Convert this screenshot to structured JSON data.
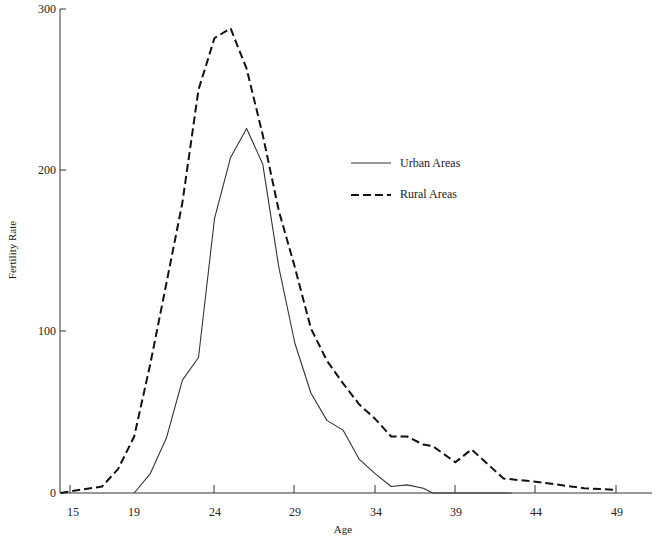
{
  "chart_data": {
    "type": "line",
    "title": "",
    "xlabel": "Age",
    "ylabel": "Fertility Rate",
    "xlim": [
      15,
      49
    ],
    "ylim": [
      0,
      300
    ],
    "x_ticks": [
      15,
      19,
      24,
      29,
      34,
      39,
      44,
      49
    ],
    "y_ticks": [
      0,
      100,
      200,
      300
    ],
    "grid": false,
    "legend_position": "upper right (inside plot)",
    "series": [
      {
        "name": "Urban Areas",
        "style": "solid",
        "color": "#333333",
        "x": [
          19,
          20,
          21,
          22,
          23,
          24,
          25,
          26,
          27,
          28,
          29,
          30,
          31,
          32,
          33,
          34,
          35,
          36,
          37,
          37.6,
          38,
          42.5
        ],
        "y": [
          0,
          12,
          34,
          70,
          84,
          170,
          208,
          226,
          204,
          140,
          93,
          62,
          45,
          39,
          21,
          12,
          4,
          5,
          3,
          0,
          0,
          0
        ]
      },
      {
        "name": "Rural Areas",
        "style": "dashed",
        "color": "#111111",
        "x": [
          14.4,
          15,
          17,
          18,
          19,
          20,
          21,
          22,
          23,
          24,
          25,
          26,
          27,
          28,
          29,
          30,
          31,
          32,
          33,
          34,
          35,
          36,
          37,
          37.6,
          39,
          40,
          42,
          44,
          47,
          49
        ],
        "y": [
          0,
          1,
          4,
          15,
          35,
          80,
          130,
          180,
          250,
          282,
          288,
          263,
          222,
          175,
          140,
          102,
          82,
          68,
          55,
          46,
          35,
          35,
          30,
          29,
          19,
          27,
          9,
          7,
          3,
          2
        ]
      }
    ]
  },
  "axes": {
    "x_title": "Age",
    "y_title": "Fertility Rate",
    "x_tick_labels": [
      "15",
      "19",
      "24",
      "29",
      "34",
      "39",
      "44",
      "49"
    ],
    "y_tick_labels": [
      "0",
      "100",
      "200",
      "300"
    ]
  },
  "legend": {
    "items": [
      {
        "label": "Urban Areas",
        "style": "solid"
      },
      {
        "label": "Rural Areas",
        "style": "dashed"
      }
    ]
  }
}
